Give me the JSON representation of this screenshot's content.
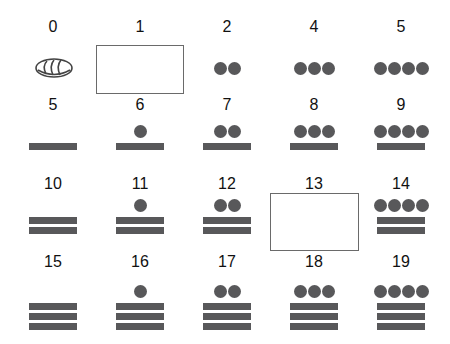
{
  "colors": {
    "glyph": "#58585a",
    "box_border": "#6a6a6a",
    "text": "#111111"
  },
  "cells": [
    {
      "label": "0",
      "dots": 0,
      "bars": 0,
      "type": "shell",
      "shell_icon": "shell-zero-icon"
    },
    {
      "label": "1",
      "type": "blank-answer-box"
    },
    {
      "label": "2",
      "dots": 2,
      "bars": 0
    },
    {
      "label": "4",
      "dots": 3,
      "bars": 0
    },
    {
      "label": "5",
      "dots": 4,
      "bars": 0
    },
    {
      "label": "5",
      "dots": 0,
      "bars": 1
    },
    {
      "label": "6",
      "dots": 1,
      "bars": 1
    },
    {
      "label": "7",
      "dots": 2,
      "bars": 1
    },
    {
      "label": "8",
      "dots": 3,
      "bars": 1
    },
    {
      "label": "9",
      "dots": 4,
      "bars": 1
    },
    {
      "label": "10",
      "dots": 0,
      "bars": 2
    },
    {
      "label": "11",
      "dots": 1,
      "bars": 2
    },
    {
      "label": "12",
      "dots": 2,
      "bars": 2
    },
    {
      "label": "13",
      "type": "blank-answer-box"
    },
    {
      "label": "14",
      "dots": 4,
      "bars": 2
    },
    {
      "label": "15",
      "dots": 0,
      "bars": 3
    },
    {
      "label": "16",
      "dots": 1,
      "bars": 3
    },
    {
      "label": "17",
      "dots": 2,
      "bars": 3
    },
    {
      "label": "18",
      "dots": 3,
      "bars": 3
    },
    {
      "label": "19",
      "dots": 4,
      "bars": 3
    }
  ]
}
